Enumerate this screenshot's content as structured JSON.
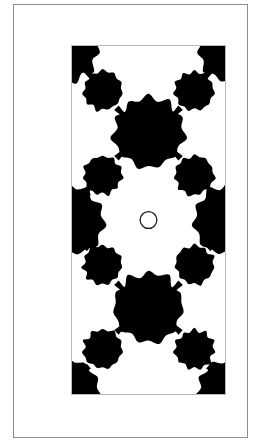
{
  "figure": {
    "title": "Symmetric binary blob pattern figure",
    "colors": {
      "background": "#ffffff",
      "pattern_fill": "#000000",
      "pattern_ground": "#ffffff",
      "outer_frame_stroke": "#8d8d8d",
      "panel_stroke": "#b9b9b9",
      "center_circle_stroke": "#1a1a1a"
    },
    "outer_frame": {
      "label": "outer frame",
      "x": 13,
      "y": 4,
      "width": 235,
      "height": 434,
      "stroke_width": 1
    },
    "panel": {
      "label": "pattern panel",
      "x": 57,
      "y": 40,
      "width": 155,
      "height": 350,
      "viewbox": "0 0 155 350"
    },
    "center_circle": {
      "label": "center circle marker",
      "cx": 77.5,
      "cy": 175,
      "r": 8.5,
      "stroke_width": 1.3,
      "fill": "none"
    },
    "symmetry": {
      "horizontal_mirror": true,
      "vertical_mirror": true,
      "center_x": 77.5,
      "center_y": 175
    },
    "blobs": [
      {
        "name": "large-blob-upper-center",
        "cx": 77.5,
        "cy": 87,
        "r": 36
      },
      {
        "name": "large-blob-lower-center",
        "cx": 77.5,
        "cy": 263,
        "r": 36
      },
      {
        "name": "medium-blob-upper-left",
        "cx": 31,
        "cy": 45,
        "r": 20
      },
      {
        "name": "medium-blob-upper-right",
        "cx": 124,
        "cy": 45,
        "r": 20
      },
      {
        "name": "medium-blob-midupper-left",
        "cx": 31,
        "cy": 130,
        "r": 20
      },
      {
        "name": "medium-blob-midupper-right",
        "cx": 124,
        "cy": 130,
        "r": 20
      },
      {
        "name": "medium-blob-midlower-left",
        "cx": 31,
        "cy": 220,
        "r": 20
      },
      {
        "name": "medium-blob-midlower-right",
        "cx": 124,
        "cy": 220,
        "r": 20
      },
      {
        "name": "medium-blob-lower-left",
        "cx": 31,
        "cy": 305,
        "r": 20
      },
      {
        "name": "medium-blob-lower-right",
        "cx": 124,
        "cy": 305,
        "r": 20
      },
      {
        "name": "edge-mass-left-middle",
        "cx": -4,
        "cy": 175,
        "r": 36
      },
      {
        "name": "edge-mass-right-middle",
        "cx": 159,
        "cy": 175,
        "r": 36
      },
      {
        "name": "corner-mass-top-left",
        "cx": -6,
        "cy": 2,
        "r": 34
      },
      {
        "name": "corner-mass-top-right",
        "cx": 161,
        "cy": 2,
        "r": 34
      },
      {
        "name": "corner-mass-bottom-left",
        "cx": -6,
        "cy": 348,
        "r": 34
      },
      {
        "name": "corner-mass-bottom-right",
        "cx": 161,
        "cy": 348,
        "r": 34
      }
    ],
    "bridges": [
      {
        "name": "bridge-top-left-to-blob",
        "x1": 14,
        "y1": 24,
        "x2": 31,
        "y2": 45
      },
      {
        "name": "bridge-top-right-to-blob",
        "x1": 141,
        "y1": 24,
        "x2": 124,
        "y2": 45
      },
      {
        "name": "bridge-upperleft-to-center",
        "x1": 45,
        "y1": 62,
        "x2": 55,
        "y2": 72
      },
      {
        "name": "bridge-upperright-to-center",
        "x1": 110,
        "y1": 62,
        "x2": 100,
        "y2": 72
      },
      {
        "name": "bridge-center-to-midleft",
        "x1": 55,
        "y1": 103,
        "x2": 45,
        "y2": 113
      },
      {
        "name": "bridge-center-to-midright",
        "x1": 100,
        "y1": 103,
        "x2": 110,
        "y2": 113
      },
      {
        "name": "bridge-midleft-to-edgeleft",
        "x1": 17,
        "y1": 147,
        "x2": 8,
        "y2": 155
      },
      {
        "name": "bridge-midright-to-edgeright",
        "x1": 138,
        "y1": 147,
        "x2": 147,
        "y2": 155
      },
      {
        "name": "bridge-edgeleft-to-lowermid",
        "x1": 8,
        "y1": 196,
        "x2": 17,
        "y2": 204
      },
      {
        "name": "bridge-edgeright-to-lowermid",
        "x1": 147,
        "y1": 196,
        "x2": 138,
        "y2": 204
      },
      {
        "name": "bridge-lowermid-to-center",
        "x1": 45,
        "y1": 238,
        "x2": 55,
        "y2": 248
      },
      {
        "name": "bridge-lowermidright-to-center",
        "x1": 110,
        "y1": 238,
        "x2": 100,
        "y2": 248
      },
      {
        "name": "bridge-center-to-lowerleft",
        "x1": 55,
        "y1": 279,
        "x2": 45,
        "y2": 288
      },
      {
        "name": "bridge-center-to-lowerright",
        "x1": 100,
        "y1": 279,
        "x2": 110,
        "y2": 288
      },
      {
        "name": "bridge-lowerleft-to-corner",
        "x1": 17,
        "y1": 322,
        "x2": 8,
        "y2": 330
      },
      {
        "name": "bridge-lowerright-to-corner",
        "x1": 138,
        "y1": 322,
        "x2": 147,
        "y2": 330
      }
    ]
  }
}
